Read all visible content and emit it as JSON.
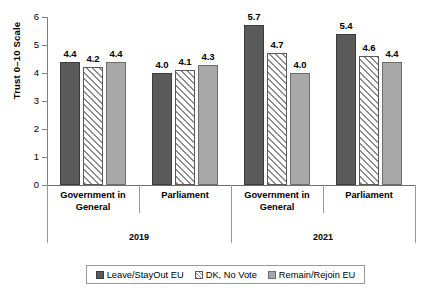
{
  "chart_data": {
    "type": "bar",
    "title": "",
    "subtitle": "",
    "xlabel": "",
    "ylabel": "Trust 0–10 Scale",
    "ylim": [
      0,
      6
    ],
    "ytick_labels": [
      "0",
      "1",
      "2",
      "3",
      "4",
      "5",
      "6"
    ],
    "ytick_values": [
      0,
      1,
      2,
      3,
      4,
      5,
      6
    ],
    "grid": false,
    "legend_position": "bottom",
    "categories": [
      "Government in General",
      "Parliament",
      "Government in General",
      "Parliament"
    ],
    "category_lines": [
      [
        "Government in",
        "General"
      ],
      [
        "Parliament"
      ],
      [
        "Government in",
        "General"
      ],
      [
        "Parliament"
      ]
    ],
    "group_labels": [
      "2019",
      "2021"
    ],
    "group_spans": [
      2,
      2
    ],
    "series": [
      {
        "name": "Leave/StayOut EU",
        "color": "#5a5a5a",
        "pattern": "solid",
        "values": [
          4.4,
          4.0,
          5.7,
          5.4
        ],
        "labels": [
          "4.4",
          "4.0",
          "5.7",
          "5.4"
        ]
      },
      {
        "name": "DK, No Vote",
        "color": "#ffffff",
        "pattern": "diagonal-hatch",
        "values": [
          4.2,
          4.1,
          4.7,
          4.6
        ],
        "labels": [
          "4.2",
          "4.1",
          "4.7",
          "4.6"
        ]
      },
      {
        "name": "Remain/Rejoin EU",
        "color": "#a8a8a8",
        "pattern": "solid",
        "values": [
          4.4,
          4.3,
          4.0,
          4.4
        ],
        "labels": [
          "4.4",
          "4.3",
          "4.0",
          "4.4"
        ]
      }
    ]
  },
  "legend": {
    "items": [
      {
        "label": "Leave/StayOut EU"
      },
      {
        "label": "DK, No Vote"
      },
      {
        "label": "Remain/Rejoin EU"
      }
    ]
  }
}
